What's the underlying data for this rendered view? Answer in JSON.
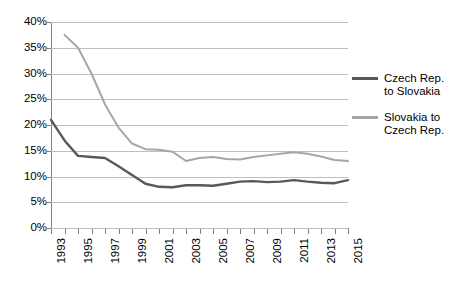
{
  "chart_data": {
    "type": "line",
    "title": "",
    "xlabel": "",
    "ylabel": "",
    "ylim": [
      0,
      40
    ],
    "yticks": [
      0,
      5,
      10,
      15,
      20,
      25,
      30,
      35,
      40
    ],
    "ytick_labels": [
      "0%",
      "5%",
      "10%",
      "15%",
      "20%",
      "25%",
      "30%",
      "35%",
      "40%"
    ],
    "grid": true,
    "legend_position": "right",
    "x": [
      1993,
      1994,
      1995,
      1996,
      1997,
      1998,
      1999,
      2000,
      2001,
      2002,
      2003,
      2004,
      2005,
      2006,
      2007,
      2008,
      2009,
      2010,
      2011,
      2012,
      2013,
      2014,
      2015
    ],
    "xtick_labels": [
      "1993",
      "",
      "1995",
      "",
      "1997",
      "",
      "1999",
      "",
      "2001",
      "",
      "2003",
      "",
      "2005",
      "",
      "2007",
      "",
      "2009",
      "",
      "2011",
      "",
      "2013",
      "",
      "2015"
    ],
    "xtick_labels_shown": [
      "1993",
      "1995",
      "1997",
      "1999",
      "2001",
      "2003",
      "2005",
      "2007",
      "2009",
      "2011",
      "2013",
      "2015"
    ],
    "series": [
      {
        "name": "Czech Rep. to Slovakia",
        "legend_label": "Czech Rep.\nto Slovakia",
        "color": "#595959",
        "values": [
          21.0,
          17.0,
          14.0,
          13.8,
          13.6,
          12.0,
          10.3,
          8.6,
          8.0,
          7.9,
          8.3,
          8.3,
          8.2,
          8.6,
          9.0,
          9.1,
          8.9,
          9.0,
          9.3,
          9.0,
          8.8,
          8.7,
          9.3
        ]
      },
      {
        "name": "Slovakia to Czech Rep.",
        "legend_label": "Slovakia to\nCzech Rep.",
        "color": "#a6a6a6",
        "values": [
          null,
          37.5,
          35.0,
          30.0,
          24.0,
          19.5,
          16.4,
          15.3,
          15.2,
          14.8,
          13.0,
          13.6,
          13.8,
          13.4,
          13.3,
          13.8,
          14.1,
          14.4,
          14.7,
          14.4,
          13.9,
          13.2,
          13.0
        ]
      }
    ]
  },
  "legend": {
    "items": [
      {
        "label": "Czech Rep.\nto Slovakia",
        "color": "#595959"
      },
      {
        "label": "Slovakia to\nCzech Rep.",
        "color": "#a6a6a6"
      }
    ]
  },
  "colors": {
    "gridline": "#bfbfbf",
    "axis": "#808080",
    "background": "#ffffff",
    "text": "#000000"
  }
}
